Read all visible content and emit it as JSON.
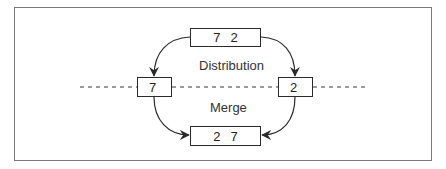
{
  "diagram": {
    "top_node": {
      "values": [
        "7",
        "2"
      ]
    },
    "left_node": {
      "values": [
        "7"
      ]
    },
    "right_node": {
      "values": [
        "2"
      ]
    },
    "bottom_node": {
      "values": [
        "2",
        "7"
      ]
    },
    "labels": {
      "distribution": "Distribution",
      "merge": "Merge"
    },
    "colors": {
      "stroke": "#2a2a2a",
      "frame": "#7a7a7a",
      "background": "#ffffff"
    }
  }
}
